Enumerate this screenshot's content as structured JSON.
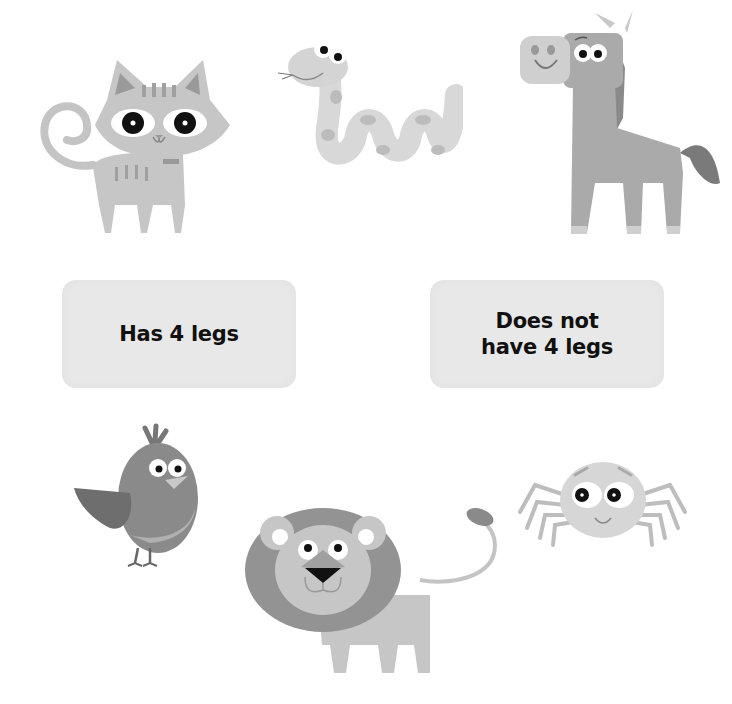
{
  "worksheet": {
    "sort_boxes": [
      {
        "id": "has-4-legs",
        "label": "Has 4 legs"
      },
      {
        "id": "not-4-legs",
        "label": "Does not\nhave 4 legs"
      }
    ],
    "animals": [
      {
        "name": "cat",
        "legs": 4
      },
      {
        "name": "snake",
        "legs": 0
      },
      {
        "name": "horse",
        "legs": 4
      },
      {
        "name": "bird",
        "legs": 2
      },
      {
        "name": "lion",
        "legs": 4
      },
      {
        "name": "spider",
        "legs": 8
      }
    ],
    "colors": {
      "light_gray": "#d4d4d4",
      "mid_gray": "#b4b4b4",
      "dark_gray": "#8a8a8a",
      "darker_gray": "#707070",
      "box_fill": "#e8e8e8",
      "eye_black": "#111111"
    }
  }
}
